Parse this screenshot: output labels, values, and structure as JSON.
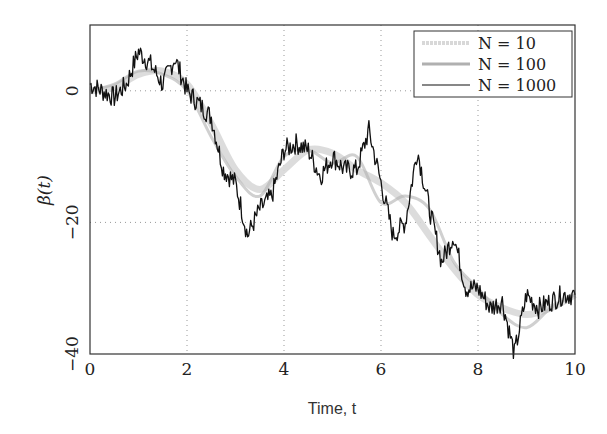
{
  "chart_data": {
    "type": "line",
    "title": "",
    "xlabel": "Time, t",
    "ylabel": "β(t)",
    "xlim": [
      0,
      10
    ],
    "ylim": [
      -40,
      10
    ],
    "grid": true,
    "grid_style": "dotted",
    "legend_position": "upper right",
    "x_ticks": [
      "0",
      "2",
      "4",
      "6",
      "8",
      "10"
    ],
    "y_ticks": [
      "0",
      "−20",
      "−40"
    ],
    "series": [
      {
        "name": "N = 10",
        "color": "#d8d8d8",
        "style": "thick light dashed",
        "x": [
          0,
          0.5,
          1,
          1.5,
          2,
          2.5,
          3,
          3.5,
          4,
          4.5,
          5,
          5.5,
          6,
          6.5,
          7,
          7.5,
          8,
          8.5,
          9,
          9.5,
          10
        ],
        "y": [
          0,
          0.5,
          2.5,
          3,
          1,
          -5,
          -12,
          -15,
          -12,
          -9,
          -9.5,
          -12,
          -14,
          -17,
          -22,
          -27,
          -31,
          -33,
          -34,
          -33,
          -31
        ]
      },
      {
        "name": "N = 100",
        "color": "#b0b0b0",
        "style": "thick gray",
        "x": [
          0,
          0.5,
          1,
          1.5,
          2,
          2.5,
          3,
          3.5,
          4,
          4.5,
          5,
          5.5,
          6,
          6.5,
          7,
          7.5,
          8,
          8.5,
          9,
          9.5,
          10
        ],
        "y": [
          0,
          1,
          3,
          2.5,
          0,
          -7,
          -13,
          -16,
          -10,
          -9,
          -11,
          -10,
          -17,
          -16,
          -18,
          -26,
          -30,
          -34,
          -36,
          -33,
          -31
        ]
      },
      {
        "name": "N = 1000",
        "color": "#111111",
        "style": "thin black",
        "x": [
          0,
          0.25,
          0.5,
          0.75,
          1.0,
          1.25,
          1.5,
          1.75,
          2.0,
          2.25,
          2.5,
          2.75,
          3.0,
          3.25,
          3.5,
          3.75,
          4.0,
          4.25,
          4.5,
          4.75,
          5.0,
          5.25,
          5.5,
          5.75,
          6.0,
          6.25,
          6.5,
          6.75,
          7.0,
          7.25,
          7.5,
          7.75,
          8.0,
          8.25,
          8.5,
          8.75,
          9.0,
          9.25,
          9.5,
          9.75,
          10.0
        ],
        "y": [
          1,
          0,
          -1,
          1,
          6,
          4,
          1,
          5,
          0,
          -2,
          -4,
          -12,
          -14,
          -22,
          -18,
          -16,
          -9,
          -8,
          -9,
          -13,
          -10,
          -12,
          -12,
          -6,
          -14,
          -22,
          -20,
          -9,
          -18,
          -26,
          -22,
          -30,
          -30,
          -33,
          -32,
          -40,
          -31,
          -33,
          -32,
          -31,
          -31
        ]
      }
    ]
  },
  "legend": {
    "items": [
      {
        "label": "N = 10"
      },
      {
        "label": "N = 100"
      },
      {
        "label": "N = 1000"
      }
    ]
  },
  "axes": {
    "xlabel": "Time, t",
    "ylabel": "β(t)"
  }
}
